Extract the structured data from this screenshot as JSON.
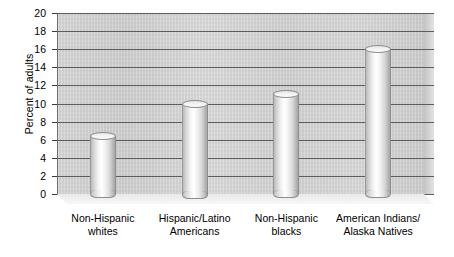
{
  "chart_data": {
    "type": "bar",
    "title": "",
    "subtitle": "",
    "xlabel": "",
    "ylabel": "Percent of adults",
    "ylim": [
      0,
      20
    ],
    "ytick_step": 2,
    "yticks": [
      20,
      18,
      16,
      14,
      12,
      10,
      8,
      6,
      4,
      2,
      0
    ],
    "grid": true,
    "legend": "none",
    "style_note": "3D cylinder bars on shaded back wall",
    "categories": [
      "Non-Hispanic whites",
      "Hispanic/Latino Americans",
      "Non-Hispanic blacks",
      "American Indians/ Alaska Natives"
    ],
    "category_lines": [
      [
        "Non-Hispanic",
        "whites"
      ],
      [
        "Hispanic/Latino",
        "Americans"
      ],
      [
        "Non-Hispanic",
        "blacks"
      ],
      [
        "American Indians/",
        "Alaska Natives"
      ]
    ],
    "values": [
      6.4,
      10.0,
      11.0,
      16.0
    ],
    "colors": {
      "bar": "#e8e8e8",
      "wall": "#d0d0d0",
      "gridline": "#5d5d5d",
      "text": "#000000",
      "background": "#ffffff"
    }
  }
}
